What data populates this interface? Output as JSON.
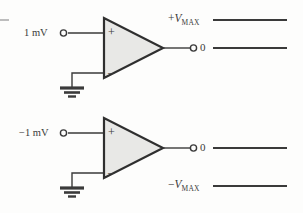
{
  "figure": {
    "background_color": "#fdfdfc",
    "line_color": "#3a3a3a",
    "triangle_fill": "#e8e8e6",
    "width": 303,
    "height": 213
  },
  "stages": [
    {
      "id": "top-stage",
      "input_label": "1 mV",
      "input_terminal": "+",
      "grounded_terminal": "-",
      "ground_label": "ground",
      "output_label": "0",
      "rail_label_plain": "+VMAX",
      "rail_sign": "+",
      "rail_symbol": "V",
      "rail_subscript": "MAX",
      "rail_position": "above-output"
    },
    {
      "id": "bottom-stage",
      "input_label": "−1 mV",
      "input_terminal": "+",
      "grounded_terminal": "-",
      "ground_label": "ground",
      "output_label": "0",
      "rail_label_plain": "−VMAX",
      "rail_sign": "−",
      "rail_symbol": "V",
      "rail_subscript": "MAX",
      "rail_position": "below-output"
    }
  ],
  "symbols": {
    "plus_terminal": "+",
    "minus_terminal": "–",
    "node_dot": "open-circle"
  }
}
